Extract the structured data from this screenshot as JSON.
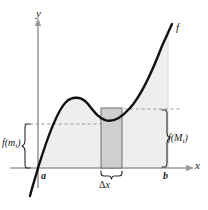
{
  "figure": {
    "type": "calculus-riemann-extreme-value-diagram",
    "axes": {
      "y_label": "y",
      "x_label": "x",
      "origin_px": {
        "x": 38,
        "y": 168
      }
    },
    "curve": {
      "label": "f",
      "color": "#111111",
      "stroke_width": 2.4,
      "x_intercept_px": 38,
      "local_max_px": {
        "x": 76,
        "y": 99
      },
      "local_min_px": {
        "x": 128,
        "y": 113
      }
    },
    "interval": {
      "left_label": "a",
      "right_label": "b",
      "left_px": 38,
      "right_px": 168
    },
    "shaded_region": {
      "fill": "#eeeeee",
      "stroke": "#d8d8d8",
      "note": "area under f from a to b"
    },
    "subinterval_rect": {
      "fill": "#cfcfcf",
      "stroke": "#6e6e6e",
      "left_px": 101,
      "right_px": 122,
      "top_px": 108,
      "bottom_px": 168,
      "width_label": "Δx",
      "width_label_delta": "Δ",
      "width_label_var": "x"
    },
    "dashed_lines": {
      "color": "#9a9a9a",
      "upper": {
        "y_px": 109,
        "from_x_px": 122,
        "to_x_px": 180,
        "note": "level of f(M_i)"
      },
      "lower": {
        "y_px": 124,
        "from_x_px": 24,
        "to_x_px": 122,
        "note": "level of f(m_i)"
      }
    },
    "braces": {
      "left": {
        "label": "f(m",
        "label_sub": "i",
        "label_close": ")",
        "label_full": "f(m_i)",
        "top_px": 124,
        "bottom_px": 168,
        "x_px": 26,
        "color": "#2a2a2a"
      },
      "right": {
        "label": "f(M",
        "label_sub": "i",
        "label_close": ")",
        "label_full": "f(M_i)",
        "top_px": 110,
        "bottom_px": 168,
        "x_px": 166,
        "color": "#2a2a2a"
      }
    },
    "colors": {
      "background": "#ffffff",
      "axis": "#9a9a9a",
      "curve": "#111111",
      "region_fill": "#eeeeee",
      "rect_fill": "#cfcfcf",
      "rect_stroke": "#6e6e6e",
      "dash": "#9a9a9a",
      "text": "#1a1a1a"
    }
  }
}
